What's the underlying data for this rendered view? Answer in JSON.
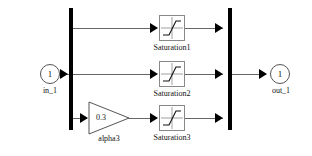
{
  "diagram": {
    "background_color": "#ffffff",
    "wire_color": "#666666",
    "bus_color": "#000000",
    "block_border_color": "#888888",
    "ports": {
      "input": {
        "number": "1",
        "label": "in_1",
        "name": "inport"
      },
      "output": {
        "number": "1",
        "label": "out_1",
        "name": "outport"
      }
    },
    "bus_bars": [
      {
        "name": "input-bus-bar"
      },
      {
        "name": "output-bus-bar"
      }
    ],
    "branches": [
      {
        "id": "top",
        "blocks": [
          {
            "type": "saturation",
            "label": "Saturation1"
          }
        ]
      },
      {
        "id": "middle",
        "blocks": [
          {
            "type": "saturation",
            "label": "Saturation2"
          }
        ]
      },
      {
        "id": "bottom",
        "blocks": [
          {
            "type": "gain",
            "label": "alpha3",
            "value": "0.3"
          },
          {
            "type": "saturation",
            "label": "Saturation3"
          }
        ]
      }
    ]
  }
}
